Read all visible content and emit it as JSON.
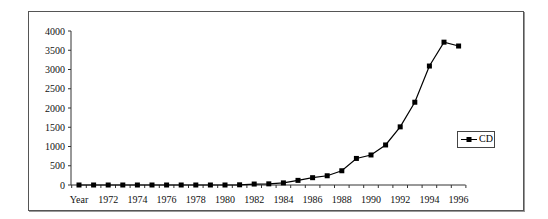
{
  "chart_data": {
    "type": "line",
    "title": "",
    "xlabel": "",
    "ylabel": "",
    "ylim": [
      0,
      4000
    ],
    "yticks": [
      0,
      500,
      1000,
      1500,
      2000,
      2500,
      3000,
      3500,
      4000
    ],
    "grid": false,
    "legend_position": "right",
    "categories": [
      "Year",
      "1971",
      "1972",
      "1973",
      "1974",
      "1975",
      "1976",
      "1977",
      "1978",
      "1979",
      "1980",
      "1981",
      "1982",
      "1983",
      "1984",
      "1985",
      "1986",
      "1987",
      "1988",
      "1989",
      "1990",
      "1991",
      "1992",
      "1993",
      "1994",
      "1995",
      "1996"
    ],
    "x_tick_labels": [
      "Year",
      "1972",
      "1974",
      "1976",
      "1978",
      "1980",
      "1982",
      "1984",
      "1986",
      "1988",
      "1990",
      "1992",
      "1994",
      "1996"
    ],
    "series": [
      {
        "name": "CD",
        "marker": "square",
        "color": "#000000",
        "values": [
          0,
          0,
          0,
          0,
          0,
          0,
          0,
          0,
          0,
          0,
          0,
          5,
          25,
          30,
          55,
          120,
          190,
          240,
          370,
          690,
          780,
          1040,
          1510,
          2150,
          3090,
          3710,
          3610
        ]
      }
    ]
  },
  "legend": {
    "label": "CD"
  }
}
